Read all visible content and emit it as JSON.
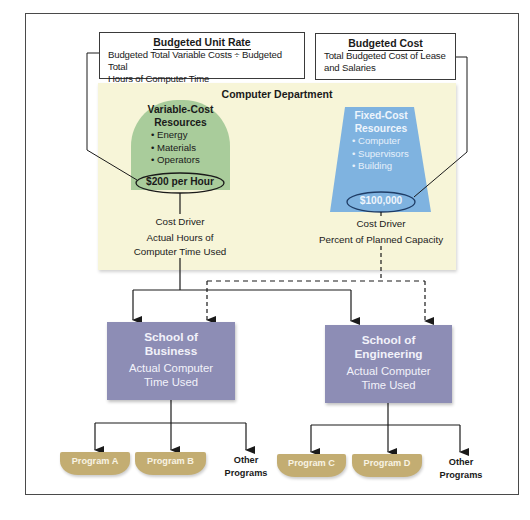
{
  "budgeted_unit_rate": {
    "title": "Budgeted Unit Rate",
    "line1": "Budgeted Total Variable Costs ÷ Budgeted Total",
    "line2": "Hours of Computer Time"
  },
  "budgeted_cost": {
    "title": "Budgeted Cost",
    "line1": "Total Budgeted Cost of Lease",
    "line2": "and Salaries"
  },
  "department": {
    "title": "Computer Department",
    "variable": {
      "title1": "Variable-Cost",
      "title2": "Resources",
      "items": [
        "Energy",
        "Materials",
        "Operators"
      ],
      "rate": "$200 per Hour",
      "driver_label": "Cost Driver",
      "driver_line1": "Actual Hours of",
      "driver_line2": "Computer Time Used",
      "color": "#a9cc9b"
    },
    "fixed": {
      "title1": "Fixed-Cost",
      "title2": "Resources",
      "items": [
        "Computer",
        "Supervisors",
        "Building"
      ],
      "amount": "$100,000",
      "driver_label": "Cost Driver",
      "driver_line1": "Percent of Planned Capacity",
      "color": "#7fb3e0"
    },
    "panel_color": "#f7f5d8"
  },
  "schools": [
    {
      "name1": "School of",
      "name2": "Business",
      "sub1": "Actual Computer",
      "sub2": "Time Used",
      "programs": [
        "Program A",
        "Program B"
      ],
      "other1": "Other",
      "other2": "Programs"
    },
    {
      "name1": "School of",
      "name2": "Engineering",
      "sub1": "Actual Computer",
      "sub2": "Time Used",
      "programs": [
        "Program C",
        "Program D"
      ],
      "other1": "Other",
      "other2": "Programs"
    }
  ],
  "colors": {
    "school": "#8d8db5",
    "program": "#c3ad72",
    "line": "#1a1a1a"
  }
}
